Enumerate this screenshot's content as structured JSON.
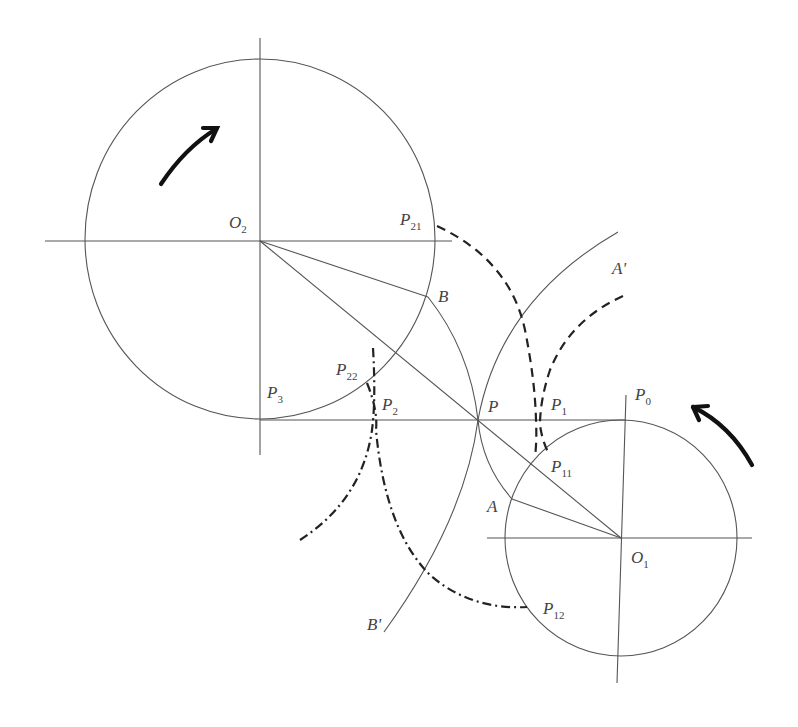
{
  "diagram": {
    "colors": {
      "line": "#555555",
      "dashed": "#222222",
      "arrow": "#111111",
      "text": "#444444"
    },
    "labels": {
      "O2": {
        "base": "O",
        "sub": "2"
      },
      "O1": {
        "base": "O",
        "sub": "1"
      },
      "P": {
        "base": "P",
        "sub": ""
      },
      "P0": {
        "base": "P",
        "sub": "0"
      },
      "P1": {
        "base": "P",
        "sub": "1"
      },
      "P2": {
        "base": "P",
        "sub": "2"
      },
      "P3": {
        "base": "P",
        "sub": "3"
      },
      "P11": {
        "base": "P",
        "sub": "11"
      },
      "P12": {
        "base": "P",
        "sub": "12"
      },
      "P21": {
        "base": "P",
        "sub": "21"
      },
      "P22": {
        "base": "P",
        "sub": "22"
      },
      "A": {
        "base": "A",
        "sub": ""
      },
      "B": {
        "base": "B",
        "sub": ""
      },
      "A_prime": {
        "base": "A'",
        "sub": ""
      },
      "B_prime": {
        "base": "B'",
        "sub": ""
      }
    },
    "circles": [
      {
        "name": "circle-O2",
        "cx": 260,
        "cy": 239,
        "rx": 175,
        "ry": 180
      },
      {
        "name": "circle-O1",
        "cx": 621,
        "cy": 538,
        "rx": 116,
        "ry": 118
      }
    ],
    "rotation_arrows": [
      {
        "name": "O2-rotation",
        "direction": "clockwise"
      },
      {
        "name": "O1-rotation",
        "direction": "counterclockwise"
      }
    ]
  }
}
